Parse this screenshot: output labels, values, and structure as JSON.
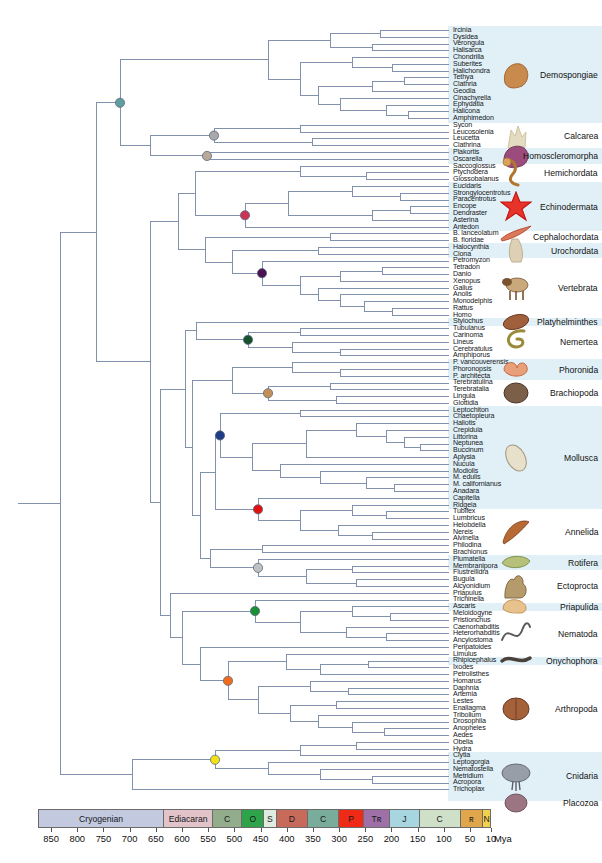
{
  "figure": {
    "type": "phylogenetic-tree",
    "title": "",
    "n_taxa": 107
  },
  "taxa": [
    "Ircinia",
    "Dysidea",
    "Verongula",
    "Halisarca",
    "Chondrilla",
    "Suberites",
    "Halichondra",
    "Tethya",
    "Clathria",
    "Geodia",
    "Cinachyrella",
    "Ephydatia",
    "Halicona",
    "Amphimedon",
    "Sycon",
    "Leucosolenia",
    "Leucetta",
    "Clathrina",
    "Plakortis",
    "Oscarella",
    "Saccoglossus",
    "Ptychodera",
    "Glossobalanus",
    "Eucidaris",
    "Strongylocentrotus",
    "Paracentrotus",
    "Encope",
    "Dendraster",
    "Asterina",
    "Antedon",
    "B. lanceolatum",
    "B. floridae",
    "Halocynthia",
    "Ciona",
    "Petromyzon",
    "Tetradon",
    "Danio",
    "Xenopus",
    "Gallus",
    "Anolis",
    "Monodelphis",
    "Rattus",
    "Homo",
    "Stylochus",
    "Tubulanus",
    "Carinoma",
    "Lineus",
    "Cerebratulus",
    "Amphiporus",
    "P. vancouverensis",
    "Phoronopsis",
    "P. architecta",
    "Terebratulina",
    "Terebratalia",
    "Lingula",
    "Glottidia",
    "Leptochiton",
    "Chaetopleura",
    "Haliotis",
    "Crepidula",
    "Littorina",
    "Neptunea",
    "Buccinum",
    "Aplysia",
    "Nucula",
    "Modiolis",
    "M. edulis",
    "M. californianus",
    "Anadara",
    "Capitella",
    "Ridgeia",
    "Tubifex",
    "Lumbricus",
    "Helobdella",
    "Nereis",
    "Alvinella",
    "Philodina",
    "Brachionus",
    "Plumatella",
    "Membranipora",
    "Flustrellidra",
    "Bugula",
    "Alcyonidium",
    "Priapulus",
    "Trichinella",
    "Ascaris",
    "Meloidogyne",
    "Pristionchus",
    "Caenorhabditis",
    "Heterorhabditis",
    "Ancylostoma",
    "Peripatoides",
    "Limulus",
    "Rhipicephalus",
    "Ixodes",
    "Petrolisthes",
    "Homarus",
    "Daphnia",
    "Artemia",
    "Lestes",
    "Enallagma",
    "Tribolium",
    "Drosophila",
    "Anopheles",
    "Aedes",
    "Obelia",
    "Hydra",
    "Clytia",
    "Leptogorgia",
    "Nematostella",
    "Metridium",
    "Acropora",
    "Trichoplax"
  ],
  "clades": [
    {
      "name": "Demospongiae",
      "icon": "sponge-brown-icon",
      "start": 0,
      "end": 13
    },
    {
      "name": "Calcarea",
      "icon": "sponge-calcareous-icon",
      "start": 14,
      "end": 17
    },
    {
      "name": "Homoscleromorpha",
      "icon": "sponge-purple-icon",
      "start": 18,
      "end": 19
    },
    {
      "name": "Hemichordata",
      "icon": "acorn-worm-icon",
      "start": 20,
      "end": 22
    },
    {
      "name": "Echinodermata",
      "icon": "starfish-icon",
      "start": 23,
      "end": 29
    },
    {
      "name": "Cephalochordata",
      "icon": "lancelet-icon",
      "start": 30,
      "end": 31
    },
    {
      "name": "Urochordata",
      "icon": "sea-squirt-icon",
      "start": 32,
      "end": 33
    },
    {
      "name": "Vertebrata",
      "icon": "dog-icon",
      "start": 34,
      "end": 42
    },
    {
      "name": "Platyhelminthes",
      "icon": "flatworm-icon",
      "start": 43,
      "end": 43
    },
    {
      "name": "Nemertea",
      "icon": "ribbon-worm-icon",
      "start": 44,
      "end": 48
    },
    {
      "name": "Phoronida",
      "icon": "phoronid-icon",
      "start": 49,
      "end": 51
    },
    {
      "name": "Brachiopoda",
      "icon": "brachiopod-icon",
      "start": 52,
      "end": 55
    },
    {
      "name": "Mollusca",
      "icon": "shell-icon",
      "start": 56,
      "end": 70
    },
    {
      "name": "Annelida",
      "icon": "annelid-icon",
      "start": 71,
      "end": 77
    },
    {
      "name": "Rotifera",
      "icon": "rotifer-icon",
      "start": 78,
      "end": 79
    },
    {
      "name": "Ectoprocta",
      "icon": "bryozoan-icon",
      "start": 80,
      "end": 84
    },
    {
      "name": "Priapulida",
      "icon": "priapulid-icon",
      "start": 85,
      "end": 85
    },
    {
      "name": "Nematoda",
      "icon": "nematode-icon",
      "start": 86,
      "end": 92
    },
    {
      "name": "Onychophora",
      "icon": "velvet-worm-icon",
      "start": 93,
      "end": 93
    },
    {
      "name": "Arthropoda",
      "icon": "crab-icon",
      "start": 94,
      "end": 106
    },
    {
      "name": "Cnidaria",
      "icon": "jellyfish-icon",
      "start": 107,
      "end": 113
    },
    {
      "name": "Placozoa",
      "icon": "placozoan-icon",
      "start": 114,
      "end": 114
    }
  ],
  "nodes": [
    {
      "name": "porifera-node",
      "color": "#5e9e9e"
    },
    {
      "name": "calcarea-node",
      "color": "#a8a8a8"
    },
    {
      "name": "homoscleromorpha-node",
      "color": "#b8a999"
    },
    {
      "name": "echinodermata-node",
      "color": "#cc3355"
    },
    {
      "name": "vertebrata-node",
      "color": "#4a1250"
    },
    {
      "name": "nemertea-node",
      "color": "#18512c"
    },
    {
      "name": "brachiopoda-node",
      "color": "#c29058"
    },
    {
      "name": "mollusca-node",
      "color": "#1e3c86"
    },
    {
      "name": "annelida-node",
      "color": "#e01010"
    },
    {
      "name": "ectoprocta-node",
      "color": "#c0c0c0"
    },
    {
      "name": "nematoda-node",
      "color": "#199033"
    },
    {
      "name": "arthropoda-node",
      "color": "#ef6c1a"
    },
    {
      "name": "cnidaria-node",
      "color": "#f2e215"
    }
  ],
  "timescale": {
    "unit_label": "Mya",
    "axis_ticks": [
      "850",
      "800",
      "750",
      "700",
      "650",
      "600",
      "550",
      "500",
      "450",
      "400",
      "350",
      "300",
      "250",
      "200",
      "150",
      "100",
      "50",
      "10"
    ],
    "axis_min_mya": 10,
    "axis_max_mya": 875,
    "periods": [
      {
        "label": "Cryogenian",
        "start_mya": 875,
        "end_mya": 635,
        "color": "#c3c9de"
      },
      {
        "label": "Ediacaran",
        "start_mya": 635,
        "end_mya": 541,
        "color": "#e3c3ca"
      },
      {
        "label": "C",
        "start_mya": 541,
        "end_mya": 485,
        "color": "#93ac8c"
      },
      {
        "label": "O",
        "start_mya": 485,
        "end_mya": 443,
        "color": "#2fa34a"
      },
      {
        "label": "S",
        "start_mya": 443,
        "end_mya": 419,
        "color": "#dfecdf"
      },
      {
        "label": "D",
        "start_mya": 419,
        "end_mya": 359,
        "color": "#c86a5a"
      },
      {
        "label": "C",
        "start_mya": 359,
        "end_mya": 299,
        "color": "#79ac9b"
      },
      {
        "label": "P",
        "start_mya": 299,
        "end_mya": 252,
        "color": "#ef2b18"
      },
      {
        "label": "Tʀ",
        "start_mya": 252,
        "end_mya": 201,
        "color": "#9f6fa8"
      },
      {
        "label": "J",
        "start_mya": 201,
        "end_mya": 145,
        "color": "#a8d6e0"
      },
      {
        "label": "C",
        "start_mya": 145,
        "end_mya": 66,
        "color": "#cfe0c8"
      },
      {
        "label": "ʀ",
        "start_mya": 66,
        "end_mya": 23,
        "color": "#e0a64b"
      },
      {
        "label": "N",
        "start_mya": 23,
        "end_mya": 0,
        "color": "#f2d24b"
      }
    ]
  },
  "colors": {
    "branch": "#7b8ca8",
    "band": "#cfe6f2",
    "background": "#ffffff"
  }
}
